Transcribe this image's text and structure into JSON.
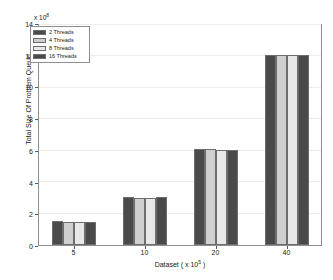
{
  "chart_data": {
    "type": "bar",
    "title": "",
    "xlabel": "Dataset ( x 10",
    "xlabel_exponent": "5",
    "xlabel_suffix": " )",
    "ylabel": "Total Size Of Problem Queue",
    "y_exponent_prefix": "x 10",
    "y_exponent": "8",
    "categories": [
      "5",
      "10",
      "20",
      "40"
    ],
    "series": [
      {
        "name": "2 Threads",
        "color": "#4a4a4a",
        "values": [
          1.5,
          3.03,
          6.1,
          12.1
        ]
      },
      {
        "name": "4 Threads",
        "color": "#cfcfcf",
        "values": [
          1.48,
          3.02,
          6.08,
          12.12
        ]
      },
      {
        "name": "8 Threads",
        "color": "#e8e8e8",
        "values": [
          1.47,
          3.0,
          6.05,
          12.1
        ]
      },
      {
        "name": "16 Threads",
        "color": "#4a4a4a",
        "values": [
          1.49,
          3.05,
          6.03,
          12.12
        ]
      }
    ],
    "ylim": [
      0,
      14
    ],
    "yticks": [
      0,
      2,
      4,
      6,
      8,
      10,
      12,
      14
    ],
    "ytick_labels": [
      "0",
      "2",
      "4",
      "6",
      "8",
      "10",
      "12",
      "14"
    ],
    "xtick_labels": [
      "5",
      "10",
      "20",
      "40"
    ],
    "grid": true,
    "legend_position": "top-left",
    "axis_color": "#8e8e8e",
    "grid_color": "#ededed",
    "bar_edge_color": "#6d6d6d",
    "background": "#ffffff"
  }
}
